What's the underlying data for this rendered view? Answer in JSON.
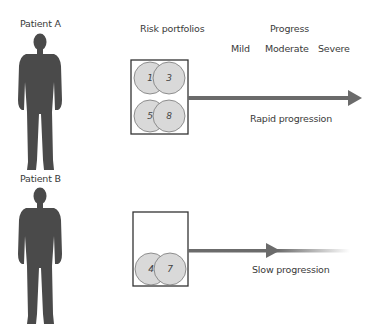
{
  "patients": [
    {
      "label": "Patient A",
      "portfolio_items": [
        "1",
        "3",
        "5",
        "8"
      ],
      "progression_label": "Rapid progression"
    },
    {
      "label": "Patient B",
      "portfolio_items": [
        "4",
        "7"
      ],
      "progression_label": "Slow progression"
    }
  ],
  "headers": {
    "risk_portfolios": "Risk portfolios",
    "progress": "Progress",
    "stages": [
      "Mild",
      "Moderate",
      "Severe"
    ]
  },
  "colors": {
    "silhouette": "#4a4a4a",
    "circle_fill": "#d9d9d9",
    "circle_stroke": "#777777",
    "arrow": "#6b6b6b",
    "box_stroke": "#333333"
  }
}
